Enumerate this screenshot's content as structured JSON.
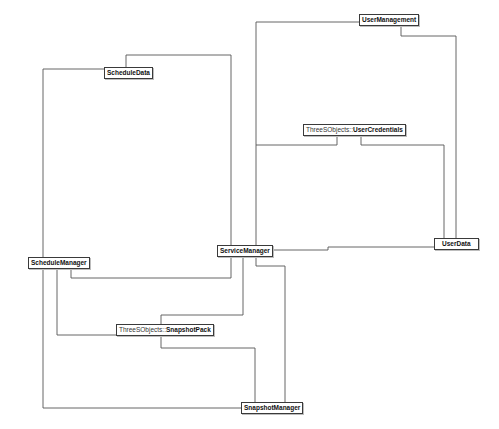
{
  "diagram": {
    "type": "class-dependency-diagram",
    "colors": {
      "background": "#ffffff",
      "edge": "#555555",
      "node_border": "#3a3a3a"
    },
    "nodes": [
      {
        "id": "UserManagement",
        "namespace": "",
        "name": "UserManagement",
        "x": 359,
        "y": 14
      },
      {
        "id": "ScheduleData",
        "namespace": "",
        "name": "ScheduleData",
        "x": 104,
        "y": 67
      },
      {
        "id": "UserCredentials",
        "namespace": "ThreeSObjects::",
        "name": "UserCredentials",
        "x": 303,
        "y": 124
      },
      {
        "id": "ServiceManager",
        "namespace": "",
        "name": "ServiceManager",
        "x": 217,
        "y": 245
      },
      {
        "id": "UserData",
        "namespace": "",
        "name": "UserData",
        "x": 434,
        "y": 238
      },
      {
        "id": "ScheduleManager",
        "namespace": "",
        "name": "ScheduleManager",
        "x": 28,
        "y": 257
      },
      {
        "id": "SnapshotPack",
        "namespace": "ThreeSObjects::",
        "name": "SnapshotPack",
        "x": 116,
        "y": 324
      },
      {
        "id": "SnapshotManager",
        "namespace": "",
        "name": "SnapshotManager",
        "x": 241,
        "y": 402
      }
    ],
    "edges": [
      {
        "from": "ScheduleData",
        "to": "ServiceManager",
        "points": "126,67 126,55 231,55 231,245"
      },
      {
        "from": "ScheduleData",
        "to": "ScheduleManager",
        "points": "104,69 43,69 43,257"
      },
      {
        "from": "UserManagement",
        "to": "ServiceManager",
        "points": "359,22 256,22 256,245"
      },
      {
        "from": "UserManagement",
        "to": "UserData",
        "points": "401,26 401,36 456,36 456,238"
      },
      {
        "from": "UserCredentials",
        "to": "ServiceManager",
        "points": "337,135 337,145 256,145"
      },
      {
        "from": "UserCredentials",
        "to": "UserData",
        "points": "361,135 361,145 444,145 444,238"
      },
      {
        "from": "ServiceManager",
        "to": "UserData",
        "points": "268,250 328,250 328,247 434,247"
      },
      {
        "from": "ScheduleManager",
        "to": "ServiceManager",
        "points": "71,269 71,278 231,278 231,256"
      },
      {
        "from": "ScheduleManager",
        "to": "SnapshotPack",
        "points": "57,269 57,335 116,335"
      },
      {
        "from": "ScheduleManager",
        "to": "SnapshotManager",
        "points": "43,269 43,408 241,408"
      },
      {
        "from": "ServiceManager",
        "to": "SnapshotPack",
        "points": "243,256 243,315 161,315 161,324"
      },
      {
        "from": "SnapshotPack",
        "to": "SnapshotManager",
        "points": "161,336 161,348 255,348 255,402"
      },
      {
        "from": "ServiceManager",
        "to": "SnapshotManager",
        "points": "256,256 256,266 285,266 285,402"
      }
    ]
  }
}
